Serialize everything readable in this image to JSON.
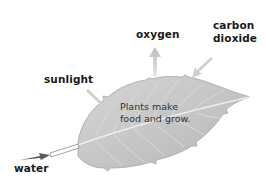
{
  "diagram": {
    "labels": {
      "oxygen": "oxygen",
      "carbon_line1": "carbon",
      "carbon_line2": "dioxide",
      "sunlight": "sunlight",
      "water": "water"
    },
    "caption_line1": "Plants make",
    "caption_line2": "food and grow.",
    "arrows": [
      {
        "name": "oxygen",
        "direction": "out"
      },
      {
        "name": "carbon dioxide",
        "direction": "in"
      },
      {
        "name": "sunlight",
        "direction": "in"
      },
      {
        "name": "water",
        "direction": "in"
      }
    ],
    "colors": {
      "leaf_fill": "#c9c9c9",
      "leaf_edge": "#a8a8a8",
      "arrow": "#c4c4c4",
      "water_arrow": "#555555",
      "text": "#1a1a1a"
    }
  }
}
